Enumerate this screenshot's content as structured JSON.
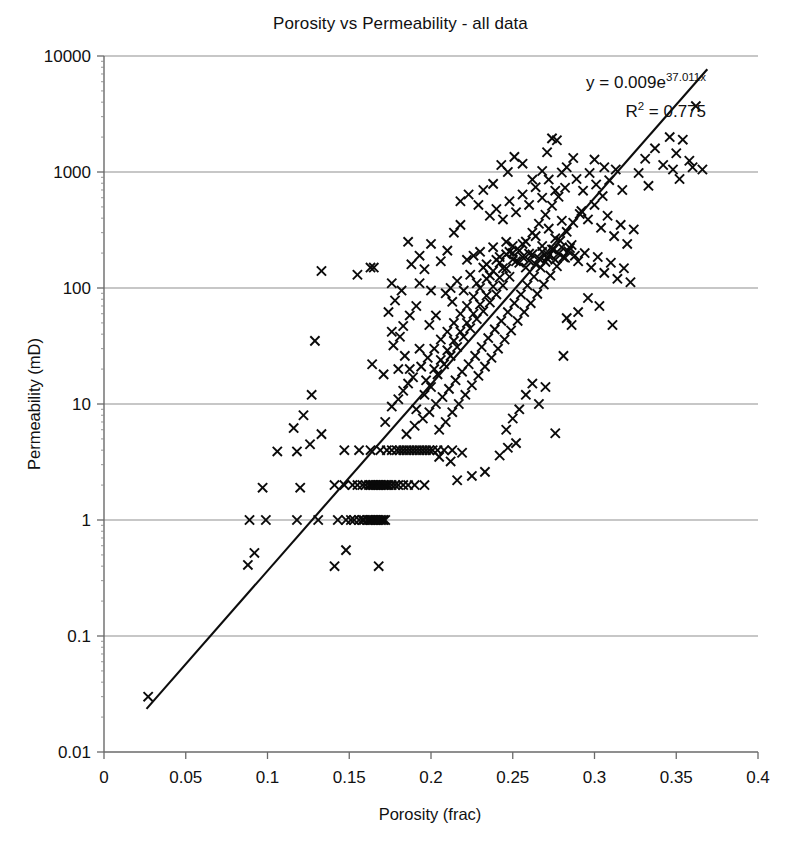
{
  "chart_data": {
    "type": "scatter",
    "title": "Porosity vs Permeability - all data",
    "xlabel": "Porosity (frac)",
    "ylabel": "Permeability (mD)",
    "xlim": [
      0,
      0.4
    ],
    "ylim": [
      0.01,
      10000
    ],
    "yscale": "log",
    "xscale": "linear",
    "grid": "horizontal-major-only",
    "legend": "none",
    "marker_symbol": "x",
    "marker_color": "#0a0a0a",
    "xticks": [
      "0",
      "0.05",
      "0.1",
      "0.15",
      "0.2",
      "0.25",
      "0.3",
      "0.35",
      "0.4"
    ],
    "xtick_values": [
      0,
      0.05,
      0.1,
      0.15,
      0.2,
      0.25,
      0.3,
      0.35,
      0.4
    ],
    "yticks": [
      "10000",
      "1000",
      "100",
      "10",
      "1",
      "0.1",
      "0.01"
    ],
    "ytick_values": [
      10000,
      1000,
      100,
      10,
      1,
      0.1,
      0.01
    ],
    "annotations": [
      {
        "name": "trendline-equation",
        "text": "y = 0.009e37.011x",
        "display_parts": {
          "lead": "y = 0.009e",
          "exponent": "37.011x"
        }
      },
      {
        "name": "r-squared",
        "text": "R2 = 0.775",
        "display_parts": {
          "lead": "R",
          "exponent": "2",
          "tail": " = 0.775"
        }
      }
    ],
    "trendline": {
      "type": "exponential",
      "equation": "y = 0.009e^(37.011x)",
      "coefficient": 0.009,
      "exponent_rate": 37.011,
      "r_squared": 0.775,
      "x_start": 0.026,
      "x_end": 0.369
    },
    "n_points": 640,
    "points": [
      [
        0.027,
        0.03
      ],
      [
        0.088,
        0.41
      ],
      [
        0.092,
        0.52
      ],
      [
        0.097,
        1.9
      ],
      [
        0.12,
        1.9
      ],
      [
        0.089,
        1.0
      ],
      [
        0.099,
        1.0
      ],
      [
        0.118,
        1.0
      ],
      [
        0.131,
        1.0
      ],
      [
        0.143,
        1.0
      ],
      [
        0.148,
        1.0
      ],
      [
        0.151,
        1.0
      ],
      [
        0.153,
        1.0
      ],
      [
        0.156,
        1.0
      ],
      [
        0.158,
        1.0
      ],
      [
        0.159,
        1.0
      ],
      [
        0.161,
        1.0
      ],
      [
        0.162,
        1.0
      ],
      [
        0.163,
        1.0
      ],
      [
        0.164,
        1.0
      ],
      [
        0.165,
        1.0
      ],
      [
        0.166,
        1.0
      ],
      [
        0.167,
        1.0
      ],
      [
        0.168,
        1.0
      ],
      [
        0.169,
        1.0
      ],
      [
        0.17,
        1.0
      ],
      [
        0.171,
        1.0
      ],
      [
        0.172,
        1.0
      ],
      [
        0.141,
        0.4
      ],
      [
        0.148,
        0.55
      ],
      [
        0.168,
        0.4
      ],
      [
        0.106,
        3.9
      ],
      [
        0.118,
        3.9
      ],
      [
        0.141,
        2.0
      ],
      [
        0.147,
        2.0
      ],
      [
        0.152,
        2.0
      ],
      [
        0.155,
        2.0
      ],
      [
        0.158,
        2.0
      ],
      [
        0.16,
        2.0
      ],
      [
        0.162,
        2.0
      ],
      [
        0.163,
        2.0
      ],
      [
        0.164,
        2.0
      ],
      [
        0.165,
        2.0
      ],
      [
        0.166,
        2.0
      ],
      [
        0.167,
        2.0
      ],
      [
        0.168,
        2.0
      ],
      [
        0.169,
        2.0
      ],
      [
        0.17,
        2.0
      ],
      [
        0.171,
        2.0
      ],
      [
        0.172,
        2.0
      ],
      [
        0.173,
        2.0
      ],
      [
        0.174,
        2.0
      ],
      [
        0.176,
        2.0
      ],
      [
        0.178,
        2.0
      ],
      [
        0.18,
        2.0
      ],
      [
        0.183,
        2.0
      ],
      [
        0.186,
        2.0
      ],
      [
        0.19,
        2.0
      ],
      [
        0.196,
        2.0
      ],
      [
        0.147,
        4.0
      ],
      [
        0.156,
        4.0
      ],
      [
        0.163,
        4.0
      ],
      [
        0.169,
        4.0
      ],
      [
        0.173,
        4.0
      ],
      [
        0.176,
        4.0
      ],
      [
        0.179,
        4.0
      ],
      [
        0.181,
        4.0
      ],
      [
        0.183,
        4.0
      ],
      [
        0.185,
        4.0
      ],
      [
        0.187,
        4.0
      ],
      [
        0.189,
        4.0
      ],
      [
        0.191,
        4.0
      ],
      [
        0.193,
        4.0
      ],
      [
        0.195,
        4.0
      ],
      [
        0.197,
        4.0
      ],
      [
        0.199,
        4.0
      ],
      [
        0.201,
        4.0
      ],
      [
        0.204,
        4.0
      ],
      [
        0.208,
        4.0
      ],
      [
        0.213,
        4.0
      ],
      [
        0.116,
        6.2
      ],
      [
        0.122,
        8.0
      ],
      [
        0.127,
        12.0
      ],
      [
        0.129,
        35.0
      ],
      [
        0.126,
        4.5
      ],
      [
        0.133,
        5.5
      ],
      [
        0.133,
        140.0
      ],
      [
        0.155,
        130.0
      ],
      [
        0.163,
        150.0
      ],
      [
        0.165,
        150.0
      ],
      [
        0.176,
        110.0
      ],
      [
        0.186,
        250.0
      ],
      [
        0.193,
        110.0
      ],
      [
        0.2,
        95.0
      ],
      [
        0.164,
        22.0
      ],
      [
        0.171,
        18.0
      ],
      [
        0.176,
        42.0
      ],
      [
        0.183,
        47.0
      ],
      [
        0.187,
        20.0
      ],
      [
        0.193,
        30.0
      ],
      [
        0.172,
        7.0
      ],
      [
        0.176,
        9.5
      ],
      [
        0.18,
        11.0
      ],
      [
        0.183,
        13.0
      ],
      [
        0.186,
        15.0
      ],
      [
        0.189,
        17.0
      ],
      [
        0.191,
        9.0
      ],
      [
        0.194,
        21.0
      ],
      [
        0.196,
        12.0
      ],
      [
        0.198,
        25.0
      ],
      [
        0.2,
        14.0
      ],
      [
        0.202,
        30.0
      ],
      [
        0.204,
        18.0
      ],
      [
        0.206,
        36.0
      ],
      [
        0.208,
        22.0
      ],
      [
        0.21,
        42.0
      ],
      [
        0.212,
        26.0
      ],
      [
        0.214,
        50.0
      ],
      [
        0.216,
        31.0
      ],
      [
        0.218,
        60.0
      ],
      [
        0.22,
        38.0
      ],
      [
        0.222,
        70.0
      ],
      [
        0.224,
        45.0
      ],
      [
        0.226,
        84.0
      ],
      [
        0.228,
        54.0
      ],
      [
        0.23,
        100.0
      ],
      [
        0.232,
        63.0
      ],
      [
        0.234,
        120.0
      ],
      [
        0.236,
        75.0
      ],
      [
        0.238,
        140.0
      ],
      [
        0.24,
        88.0
      ],
      [
        0.242,
        165.0
      ],
      [
        0.244,
        105.0
      ],
      [
        0.246,
        195.0
      ],
      [
        0.248,
        125.0
      ],
      [
        0.25,
        230.0
      ],
      [
        0.185,
        5.5
      ],
      [
        0.19,
        6.5
      ],
      [
        0.195,
        7.5
      ],
      [
        0.199,
        8.5
      ],
      [
        0.203,
        10.0
      ],
      [
        0.207,
        11.5
      ],
      [
        0.211,
        13.5
      ],
      [
        0.215,
        16.0
      ],
      [
        0.219,
        19.0
      ],
      [
        0.223,
        22.0
      ],
      [
        0.227,
        26.0
      ],
      [
        0.231,
        31.0
      ],
      [
        0.235,
        37.0
      ],
      [
        0.239,
        44.0
      ],
      [
        0.243,
        52.0
      ],
      [
        0.247,
        62.0
      ],
      [
        0.251,
        74.0
      ],
      [
        0.255,
        88.0
      ],
      [
        0.259,
        105.0
      ],
      [
        0.263,
        125.0
      ],
      [
        0.267,
        150.0
      ],
      [
        0.271,
        180.0
      ],
      [
        0.275,
        215.0
      ],
      [
        0.279,
        255.0
      ],
      [
        0.283,
        305.0
      ],
      [
        0.287,
        365.0
      ],
      [
        0.291,
        435.0
      ],
      [
        0.197,
        16.0
      ],
      [
        0.202,
        20.0
      ],
      [
        0.206,
        24.0
      ],
      [
        0.21,
        29.0
      ],
      [
        0.214,
        35.0
      ],
      [
        0.218,
        42.0
      ],
      [
        0.222,
        50.0
      ],
      [
        0.226,
        60.0
      ],
      [
        0.23,
        72.0
      ],
      [
        0.234,
        86.0
      ],
      [
        0.238,
        103.0
      ],
      [
        0.242,
        123.0
      ],
      [
        0.246,
        147.0
      ],
      [
        0.25,
        176.0
      ],
      [
        0.254,
        210.0
      ],
      [
        0.258,
        251.0
      ],
      [
        0.262,
        300.0
      ],
      [
        0.266,
        358.0
      ],
      [
        0.27,
        428.0
      ],
      [
        0.274,
        512.0
      ],
      [
        0.278,
        612.0
      ],
      [
        0.282,
        732.0
      ],
      [
        0.205,
        6.0
      ],
      [
        0.209,
        7.0
      ],
      [
        0.213,
        8.5
      ],
      [
        0.217,
        10.0
      ],
      [
        0.221,
        12.0
      ],
      [
        0.225,
        14.5
      ],
      [
        0.229,
        17.5
      ],
      [
        0.233,
        21.0
      ],
      [
        0.237,
        25.0
      ],
      [
        0.241,
        30.0
      ],
      [
        0.245,
        36.0
      ],
      [
        0.249,
        43.0
      ],
      [
        0.253,
        52.0
      ],
      [
        0.257,
        62.0
      ],
      [
        0.261,
        74.0
      ],
      [
        0.265,
        89.0
      ],
      [
        0.269,
        107.0
      ],
      [
        0.273,
        128.0
      ],
      [
        0.277,
        154.0
      ],
      [
        0.281,
        184.0
      ],
      [
        0.285,
        221.0
      ],
      [
        0.212,
        100.0
      ],
      [
        0.216,
        115.0
      ],
      [
        0.22,
        95.0
      ],
      [
        0.224,
        130.0
      ],
      [
        0.228,
        110.0
      ],
      [
        0.232,
        150.0
      ],
      [
        0.236,
        128.0
      ],
      [
        0.24,
        175.0
      ],
      [
        0.244,
        148.0
      ],
      [
        0.248,
        205.0
      ],
      [
        0.252,
        170.0
      ],
      [
        0.256,
        240.0
      ],
      [
        0.26,
        198.0
      ],
      [
        0.264,
        280.0
      ],
      [
        0.268,
        230.0
      ],
      [
        0.272,
        325.0
      ],
      [
        0.276,
        268.0
      ],
      [
        0.28,
        380.0
      ],
      [
        0.222,
        175.0
      ],
      [
        0.226,
        190.0
      ],
      [
        0.23,
        205.0
      ],
      [
        0.234,
        160.0
      ],
      [
        0.238,
        225.0
      ],
      [
        0.242,
        185.0
      ],
      [
        0.246,
        250.0
      ],
      [
        0.25,
        200.0
      ],
      [
        0.254,
        165.0
      ],
      [
        0.256,
        185.0
      ],
      [
        0.258,
        150.0
      ],
      [
        0.26,
        172.0
      ],
      [
        0.262,
        195.0
      ],
      [
        0.264,
        160.0
      ],
      [
        0.266,
        180.0
      ],
      [
        0.268,
        205.0
      ],
      [
        0.27,
        168.0
      ],
      [
        0.272,
        190.0
      ],
      [
        0.274,
        215.0
      ],
      [
        0.276,
        175.0
      ],
      [
        0.278,
        198.0
      ],
      [
        0.28,
        225.0
      ],
      [
        0.282,
        182.0
      ],
      [
        0.284,
        207.0
      ],
      [
        0.286,
        235.0
      ],
      [
        0.288,
        190.0
      ],
      [
        0.236,
        420.0
      ],
      [
        0.24,
        480.0
      ],
      [
        0.244,
        390.0
      ],
      [
        0.248,
        560.0
      ],
      [
        0.252,
        450.0
      ],
      [
        0.256,
        640.0
      ],
      [
        0.26,
        520.0
      ],
      [
        0.264,
        740.0
      ],
      [
        0.268,
        600.0
      ],
      [
        0.272,
        860.0
      ],
      [
        0.276,
        690.0
      ],
      [
        0.28,
        990.0
      ],
      [
        0.243,
        1150.0
      ],
      [
        0.247,
        1000.0
      ],
      [
        0.251,
        1350.0
      ],
      [
        0.256,
        1180.0
      ],
      [
        0.262,
        860.0
      ],
      [
        0.268,
        1020.0
      ],
      [
        0.274,
        1950.0
      ],
      [
        0.277,
        1880.0
      ],
      [
        0.271,
        1480.0
      ],
      [
        0.218,
        560.0
      ],
      [
        0.223,
        640.0
      ],
      [
        0.229,
        520.0
      ],
      [
        0.214,
        300.0
      ],
      [
        0.218,
        350.0
      ],
      [
        0.232,
        700.0
      ],
      [
        0.238,
        790.0
      ],
      [
        0.289,
        870.0
      ],
      [
        0.293,
        690.0
      ],
      [
        0.297,
        980.0
      ],
      [
        0.301,
        780.0
      ],
      [
        0.305,
        620.0
      ],
      [
        0.309,
        850.0
      ],
      [
        0.313,
        1050.0
      ],
      [
        0.317,
        700.0
      ],
      [
        0.292,
        460.0
      ],
      [
        0.296,
        390.0
      ],
      [
        0.3,
        520.0
      ],
      [
        0.304,
        330.0
      ],
      [
        0.308,
        420.0
      ],
      [
        0.312,
        280.0
      ],
      [
        0.316,
        350.0
      ],
      [
        0.32,
        240.0
      ],
      [
        0.324,
        320.0
      ],
      [
        0.29,
        170.0
      ],
      [
        0.294,
        200.0
      ],
      [
        0.298,
        150.0
      ],
      [
        0.302,
        185.0
      ],
      [
        0.306,
        135.0
      ],
      [
        0.31,
        165.0
      ],
      [
        0.314,
        120.0
      ],
      [
        0.318,
        148.0
      ],
      [
        0.322,
        112.0
      ],
      [
        0.296,
        82.0
      ],
      [
        0.303,
        70.0
      ],
      [
        0.311,
        48.0
      ],
      [
        0.29,
        62.0
      ],
      [
        0.286,
        48.0
      ],
      [
        0.283,
        55.0
      ],
      [
        0.281,
        26.0
      ],
      [
        0.276,
        5.6
      ],
      [
        0.258,
        12.0
      ],
      [
        0.262,
        15.0
      ],
      [
        0.266,
        10.0
      ],
      [
        0.27,
        14.0
      ],
      [
        0.254,
        9.0
      ],
      [
        0.25,
        7.5
      ],
      [
        0.246,
        6.0
      ],
      [
        0.247,
        4.2
      ],
      [
        0.252,
        4.6
      ],
      [
        0.242,
        3.6
      ],
      [
        0.205,
        3.5
      ],
      [
        0.212,
        3.2
      ],
      [
        0.219,
        3.8
      ],
      [
        0.225,
        2.4
      ],
      [
        0.233,
        2.6
      ],
      [
        0.216,
        2.2
      ],
      [
        0.331,
        1300.0
      ],
      [
        0.337,
        1600.0
      ],
      [
        0.342,
        1150.0
      ],
      [
        0.346,
        2000.0
      ],
      [
        0.35,
        1450.0
      ],
      [
        0.354,
        1900.0
      ],
      [
        0.358,
        1250.0
      ],
      [
        0.362,
        3700.0
      ],
      [
        0.366,
        1050.0
      ],
      [
        0.348,
        1050.0
      ],
      [
        0.36,
        1100.0
      ],
      [
        0.352,
        870.0
      ],
      [
        0.327,
        980.0
      ],
      [
        0.333,
        760.0
      ],
      [
        0.3,
        1280.0
      ],
      [
        0.306,
        1100.0
      ],
      [
        0.287,
        1320.0
      ],
      [
        0.283,
        1100.0
      ],
      [
        0.193,
        190.0
      ],
      [
        0.188,
        160.0
      ],
      [
        0.206,
        170.0
      ],
      [
        0.21,
        210.0
      ],
      [
        0.2,
        240.0
      ],
      [
        0.196,
        145.0
      ],
      [
        0.182,
        95.0
      ],
      [
        0.178,
        78.0
      ],
      [
        0.174,
        62.0
      ],
      [
        0.191,
        70.0
      ],
      [
        0.187,
        58.0
      ],
      [
        0.199,
        48.0
      ],
      [
        0.203,
        58.0
      ],
      [
        0.184,
        26.0
      ],
      [
        0.18,
        20.0
      ],
      [
        0.209,
        90.0
      ],
      [
        0.213,
        76.0
      ],
      [
        0.177,
        32.0
      ],
      [
        0.181,
        38.0
      ]
    ],
    "notable_features": [
      "Strong positive log-linear correlation between porosity and permeability",
      "Horizontal quantization bands at permeability = 1, 2 and 4 mD",
      "Isolated high-permeability outliers near porosity 0.13 to 0.20",
      "Single extreme low point at porosity 0.027, permeability 0.03 mD"
    ]
  }
}
